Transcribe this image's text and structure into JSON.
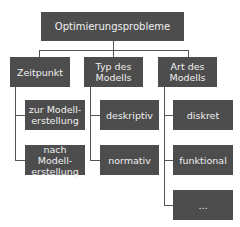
{
  "root": {
    "label": "Optimierungsprobleme"
  },
  "categories": [
    {
      "label": "Zeitpunkt",
      "children": [
        "zur Modell-\nerstellung",
        "nach Modell-\nerstellung"
      ]
    },
    {
      "label": "Typ des\nModells",
      "children": [
        "deskriptiv",
        "normativ"
      ]
    },
    {
      "label": "Art des\nModells",
      "children": [
        "diskret",
        "funktional",
        "..."
      ]
    }
  ],
  "colors": {
    "box": "#4d4d4d",
    "text": "#f0f0f0",
    "line": "#555555"
  }
}
